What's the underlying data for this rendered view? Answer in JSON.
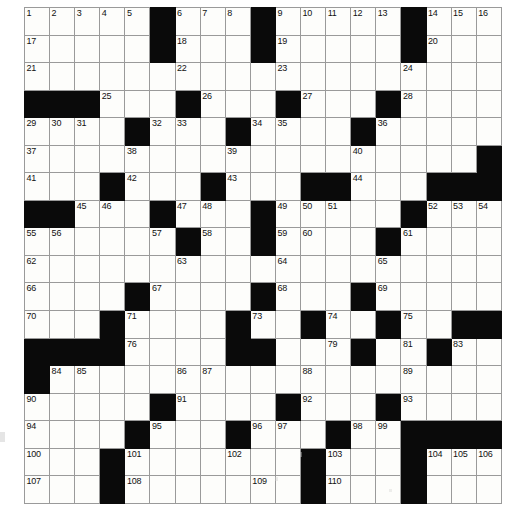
{
  "puzzle": {
    "type": "crossword-grid",
    "rows": 18,
    "cols": 19,
    "colors": {
      "block": "#0a0a0a",
      "cell": "#fdfdfb",
      "rule": "#9a9a9a",
      "number": "#111111"
    },
    "grid": [
      "...........................",
      "WWWWWBWWWBWWWWWBWWW",
      "WWWWWBWWWBWWWWWBWWW",
      "WWWWWWWWWWWWWWWWWWW",
      "BBBWWWBWWWBWWWBWWWW",
      "WWWWBWWWBWWWWBWWWWW",
      "WWWWWWWWWWWWWWWWWWB",
      "WWWBWWWBWWWBBWWWBBB",
      "BBWWWBWWWBWWWWWBWWW",
      "WWWWWWBWWBWWWWBWWWW",
      "WWWWWWWWWWWWWWWWWWW",
      "WWWWBWWWWBWWWBWWWWW",
      "WWWBWWWWBWWBWWBWWBB",
      "BBBBWWWBBWWWBWWBWWW",
      "BWWWWWWWWWWWWWWWWWW",
      "WWWWWBWWWWBWWWBWWWW",
      "WWWWBWWWBWWWBWWBBBB",
      "WWWWWWWWWWWWWWWWWWW"
    ],
    "grid_legend": {
      "W": "white-cell",
      "B": "black-cell"
    },
    "black_cells": {
      "r1": [
        6,
        10,
        16
      ],
      "r2": [
        6,
        10,
        16
      ],
      "r3": [],
      "r4": [
        1,
        2,
        3,
        7,
        11,
        15
      ],
      "r5": [
        5,
        9,
        14
      ],
      "r6": [
        19
      ],
      "r7": [
        4,
        8,
        12,
        13,
        17,
        18,
        19
      ],
      "r8": [
        1,
        2,
        6,
        10,
        16
      ],
      "r9": [
        7,
        10,
        15
      ],
      "r10": [],
      "r11": [
        5,
        10,
        14
      ],
      "r12": [
        4,
        9,
        12,
        15,
        18,
        19
      ],
      "r13": [
        1,
        2,
        3,
        4,
        9,
        10,
        14,
        17
      ],
      "r14": [
        1
      ],
      "r15": [
        6,
        11,
        15
      ],
      "r16": [
        5,
        9,
        13,
        16,
        17,
        18,
        19
      ],
      "r17": [
        4,
        12,
        16
      ],
      "r18": [
        4,
        12,
        16
      ]
    },
    "numbers": {
      "r1": {
        "1": 1,
        "2": 2,
        "3": 3,
        "4": 4,
        "5": 5,
        "7": 6,
        "8": 7,
        "9": 8,
        "11": 9,
        "12": 10,
        "13": 11,
        "14": 12,
        "15": 13,
        "17": 14,
        "18": 15,
        "19": 16
      },
      "r2": {
        "1": 17,
        "7": 18,
        "11": 19,
        "17": 20
      },
      "r3": {
        "1": 21,
        "7": 22,
        "11": 23,
        "16": 24
      },
      "r4": {
        "4": 25,
        "8": 26,
        "12": 27,
        "16": 28
      },
      "r5": {
        "1": 29,
        "2": 30,
        "3": 31,
        "6": 32,
        "7": 33,
        "10": 34,
        "11": 35,
        "15": 36
      },
      "r6": {
        "1": 37,
        "5": 38,
        "9": 39,
        "14": 40
      },
      "r7": {
        "1": 41,
        "5": 42,
        "9": 43,
        "14": 44
      },
      "r8": {
        "3": 45,
        "4": 46,
        "7": 47,
        "8": 48,
        "11": 49,
        "12": 50,
        "13": 51,
        "17": 52,
        "18": 53,
        "19": 54
      },
      "r9": {
        "1": 55,
        "2": 56,
        "6": 57,
        "8": 58,
        "11": 59,
        "12": 60,
        "16": 61
      },
      "r10": {
        "1": 62,
        "7": 63,
        "11": 64,
        "15": 65
      },
      "r11": {
        "1": 66,
        "6": 67,
        "11": 68,
        "15": 69
      },
      "r12": {
        "1": 70,
        "5": 71,
        "9": 72,
        "10": 73,
        "13": 74,
        "16": 75
      },
      "r13": {
        "5": 76,
        "9": 77,
        "10": 78,
        "13": 79,
        "14": 80,
        "16": 81,
        "17": 82,
        "18": 83
      },
      "r14": {
        "2": 84,
        "3": 85,
        "7": 86,
        "8": 87,
        "12": 88,
        "16": 89
      },
      "r15": {
        "1": 90,
        "7": 91,
        "12": 92,
        "16": 93
      },
      "r16": {
        "1": 94,
        "6": 95,
        "10": 96,
        "11": 97,
        "14": 98,
        "15": 99
      },
      "r17": {
        "1": 100,
        "5": 101,
        "9": 102,
        "13": 103,
        "17": 104,
        "18": 105,
        "19": 106
      },
      "r18": {
        "1": 107,
        "5": 108,
        "10": 109,
        "13": 110
      }
    },
    "max_number": 114,
    "numbers_rows_17_18_note": "last two rows carry 107-114"
  }
}
